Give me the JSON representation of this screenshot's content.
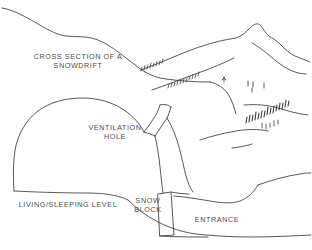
{
  "figure": {
    "kind": "hand-drawn pen-and-ink cross-section diagram",
    "background_color": "#ffffff",
    "ink_color": "#3a3a3a",
    "text_color": "#4a4a4a"
  },
  "labels": {
    "title": "CROSS SECTION OF A\nSNOWDRIFT",
    "ventilation": "VENTILATION\nHOLE",
    "living_level": "LIVING/SLEEPING LEVEL",
    "snow_block": "SNOW\nBLOCK",
    "entrance": "ENTRANCE"
  },
  "parts": [
    {
      "name": "snowdrift-surface",
      "note": "upper snow surface sweeping from top-left down to the right"
    },
    {
      "name": "sleeping-chamber",
      "note": "large domed cavity at left"
    },
    {
      "name": "ventilation-shaft",
      "note": "narrow angled shaft from chamber roof to the snow surface"
    },
    {
      "name": "snow-block-door",
      "note": "narrow tilted block plugging the chamber from the entrance"
    },
    {
      "name": "entrance-tunnel",
      "note": "low tunnel sloping up and out to the right"
    },
    {
      "name": "mountain-range",
      "note": "ridge lines and peak sketched at the upper right"
    },
    {
      "name": "tree-marks",
      "note": "clusters of small conifer ticks along the ridges"
    }
  ]
}
